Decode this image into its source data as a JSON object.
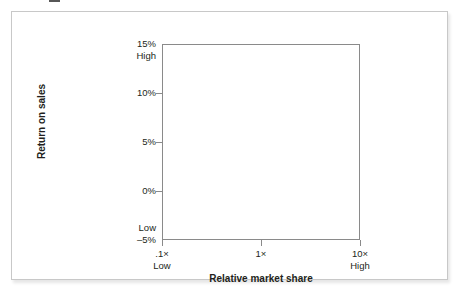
{
  "chart_data": {
    "type": "scatter",
    "title": "",
    "subtitle": "",
    "xlabel": "Relative market share",
    "ylabel": "Return on sales",
    "grid": false,
    "legend": null,
    "series": [],
    "x": [],
    "values": [],
    "xlim": [
      0.1,
      10
    ],
    "xscale": "log",
    "xticks": [
      {
        "value": "0.1",
        "label": ".1×",
        "sublabel": "Low",
        "pos_pct": 0
      },
      {
        "value": "1",
        "label": "1×",
        "sublabel": "",
        "pos_pct": 50
      },
      {
        "value": "10",
        "label": "10×",
        "sublabel": "High",
        "pos_pct": 100
      }
    ],
    "ylim": [
      -5,
      15
    ],
    "yticks": [
      {
        "value": "15",
        "label": "15%",
        "sublabel": "High",
        "pos_pct": 0,
        "has_mark": false
      },
      {
        "value": "10",
        "label": "10%",
        "sublabel": "",
        "pos_pct": 25,
        "has_mark": true
      },
      {
        "value": "5",
        "label": "5%",
        "sublabel": "",
        "pos_pct": 50,
        "has_mark": true
      },
      {
        "value": "0",
        "label": "0%",
        "sublabel": "",
        "pos_pct": 75,
        "has_mark": true
      },
      {
        "value": "-5",
        "label": "–5%",
        "sublabel": "Low",
        "pos_pct": 100,
        "has_mark": false
      }
    ],
    "annotations": [],
    "note": "Empty plotting frame — axes only, no plotted data points"
  },
  "colors": {
    "axis_line": "#8a8a8a",
    "text": "#231f20",
    "card_border": "#c8c8c8",
    "background": "#ffffff"
  }
}
